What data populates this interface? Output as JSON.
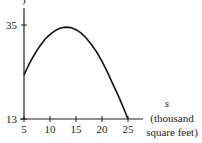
{
  "chart_data": {
    "type": "line",
    "title": "",
    "xlabel_var": "s",
    "xlabel_unit_1": "(thousand",
    "xlabel_unit_2": "square feet)",
    "top_cut_label": ")",
    "xlim": [
      5,
      25
    ],
    "ylim": [
      13,
      35
    ],
    "x_ticks": [
      5,
      10,
      15,
      20,
      25
    ],
    "y_ticks": [
      13,
      35
    ],
    "series": [
      {
        "name": "curve",
        "x": [
          5,
          6,
          7,
          8,
          9,
          10,
          11,
          12,
          13,
          14,
          15,
          16,
          17,
          18,
          19,
          20,
          21,
          22,
          23,
          24,
          25
        ],
        "y": [
          23.3,
          25.9,
          28.1,
          30.0,
          31.6,
          32.8,
          33.7,
          34.3,
          34.5,
          34.4,
          33.9,
          33.1,
          31.9,
          30.4,
          28.6,
          26.5,
          24.1,
          21.4,
          18.8,
          16.0,
          13.0
        ]
      }
    ]
  }
}
